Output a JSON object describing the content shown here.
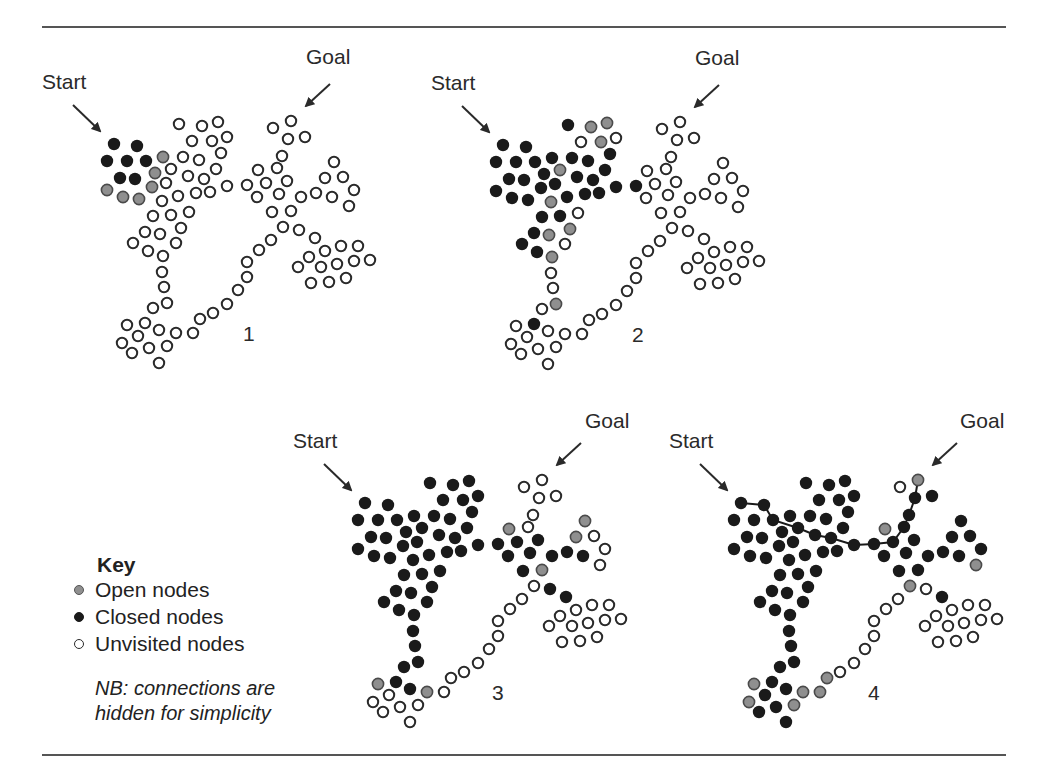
{
  "figure": {
    "rules": {
      "top_y": 27,
      "bottom_y": 755,
      "left_x": 42,
      "right_x": 1006
    },
    "colors": {
      "open": "#8f8f8f",
      "closed": "#1a1a1a",
      "unvisited_fill": "#ffffff",
      "stroke": "#2a2a2a",
      "path": "#1a1a1a"
    }
  },
  "key": {
    "title": "Key",
    "items": [
      {
        "label": "Open nodes",
        "state": "open"
      },
      {
        "label": "Closed nodes",
        "state": "closed"
      },
      {
        "label": "Unvisited nodes",
        "state": "unvisited"
      }
    ],
    "note_line1": "NB: connections are",
    "note_line2": "hidden for simplicity"
  },
  "base_nodes": [
    [
      114,
      144
    ],
    [
      137,
      146
    ],
    [
      107,
      161
    ],
    [
      127,
      161
    ],
    [
      146,
      161
    ],
    [
      120,
      178
    ],
    [
      135,
      179
    ],
    [
      163,
      157
    ],
    [
      155,
      173
    ],
    [
      152,
      187
    ],
    [
      107,
      190
    ],
    [
      123,
      197
    ],
    [
      139,
      199
    ],
    [
      179,
      124
    ],
    [
      202,
      126
    ],
    [
      218,
      122
    ],
    [
      192,
      141
    ],
    [
      212,
      141
    ],
    [
      227,
      137
    ],
    [
      183,
      157
    ],
    [
      199,
      160
    ],
    [
      221,
      153
    ],
    [
      171,
      169
    ],
    [
      188,
      176
    ],
    [
      204,
      179
    ],
    [
      216,
      169
    ],
    [
      166,
      183
    ],
    [
      178,
      196
    ],
    [
      196,
      193
    ],
    [
      210,
      192
    ],
    [
      227,
      186
    ],
    [
      247,
      185
    ],
    [
      162,
      201
    ],
    [
      189,
      212
    ],
    [
      153,
      216
    ],
    [
      171,
      215
    ],
    [
      145,
      232
    ],
    [
      160,
      234
    ],
    [
      181,
      228
    ],
    [
      133,
      243
    ],
    [
      148,
      251
    ],
    [
      163,
      256
    ],
    [
      176,
      243
    ],
    [
      162,
      272
    ],
    [
      164,
      287
    ],
    [
      167,
      303
    ],
    [
      153,
      308
    ],
    [
      145,
      323
    ],
    [
      127,
      325
    ],
    [
      159,
      330
    ],
    [
      176,
      333
    ],
    [
      138,
      336
    ],
    [
      122,
      343
    ],
    [
      149,
      348
    ],
    [
      167,
      346
    ],
    [
      132,
      353
    ],
    [
      159,
      363
    ],
    [
      193,
      333
    ],
    [
      200,
      319
    ],
    [
      213,
      313
    ],
    [
      227,
      304
    ],
    [
      238,
      290
    ],
    [
      247,
      277
    ],
    [
      247,
      262
    ],
    [
      259,
      250
    ],
    [
      271,
      240
    ],
    [
      273,
      128
    ],
    [
      291,
      121
    ],
    [
      288,
      139
    ],
    [
      305,
      137
    ],
    [
      282,
      156
    ],
    [
      258,
      170
    ],
    [
      277,
      168
    ],
    [
      266,
      183
    ],
    [
      287,
      181
    ],
    [
      257,
      197
    ],
    [
      279,
      194
    ],
    [
      301,
      197
    ],
    [
      316,
      193
    ],
    [
      332,
      197
    ],
    [
      272,
      212
    ],
    [
      291,
      211
    ],
    [
      283,
      227
    ],
    [
      299,
      230
    ],
    [
      315,
      238
    ],
    [
      334,
      162
    ],
    [
      325,
      178
    ],
    [
      343,
      177
    ],
    [
      354,
      190
    ],
    [
      349,
      206
    ],
    [
      325,
      251
    ],
    [
      341,
      246
    ],
    [
      358,
      246
    ],
    [
      309,
      257
    ],
    [
      298,
      267
    ],
    [
      321,
      267
    ],
    [
      337,
      264
    ],
    [
      354,
      261
    ],
    [
      370,
      260
    ],
    [
      311,
      283
    ],
    [
      329,
      282
    ],
    [
      346,
      278
    ]
  ],
  "panels": [
    {
      "number": "1",
      "dx": 0,
      "dy": 0,
      "start_label": "Start",
      "start_label_pos": [
        42,
        70
      ],
      "start_arrow": [
        [
          73,
          105
        ],
        [
          100,
          131
        ]
      ],
      "goal_label": "Goal",
      "goal_label_pos": [
        306,
        45
      ],
      "goal_arrow": [
        [
          330,
          84
        ],
        [
          306,
          106
        ]
      ],
      "number_pos": [
        243,
        322
      ],
      "states": "cccccccoooooouuuuuuuuuuuuuuuuuuuuuuuuuuuuuuuuuuuuuuuuuuuuuuuuuuuuuuuuuuuuuuuuuuuuuuuuuuuuuuuuuuuuuuuu",
      "path": []
    },
    {
      "number": "2",
      "dx": 389,
      "dy": 1,
      "start_label": "Start",
      "start_label_pos": [
        431,
        71
      ],
      "start_arrow": [
        [
          462,
          106
        ],
        [
          489,
          132
        ]
      ],
      "goal_label": "Goal",
      "goal_label_pos": [
        695,
        46
      ],
      "goal_arrow": [
        [
          719,
          85
        ],
        [
          695,
          107
        ]
      ],
      "number_pos": [
        632,
        323
      ],
      "states": "ccccccccccccccoououcccocccccccccoucccooccouuuoucuuuuuuuuuuuuuuuuuuuuuuuuuuuuuuuuuuuuuuuuuuuuuuuuuuuuuu",
      "path": []
    },
    {
      "number": "3",
      "dx": 251,
      "dy": 359,
      "start_label": "Start",
      "start_label_pos": [
        293,
        429
      ],
      "start_arrow": [
        [
          324,
          464
        ],
        [
          351,
          490
        ]
      ],
      "goal_label": "Goal",
      "goal_label_pos": [
        585,
        409
      ],
      "goal_arrow": [
        [
          581,
          443
        ],
        [
          557,
          465
        ]
      ],
      "number_pos": [
        492,
        681
      ],
      "states": "ccccccccccccccccccccccccccccccccccccccccccccccccocouuuuuuuuuuuuuuuuuuuuouccccccccouccoouuuuuuuuuuuuuuuuuu",
      "path": []
    },
    {
      "number": "4",
      "dx": 627,
      "dy": 359,
      "start_label": "Start",
      "start_label_pos": [
        669,
        429
      ],
      "start_arrow": [
        [
          700,
          464
        ],
        [
          727,
          490
        ]
      ],
      "goal_label": "Goal",
      "goal_label_pos": [
        960,
        409
      ],
      "goal_arrow": [
        [
          957,
          443
        ],
        [
          933,
          465
        ]
      ],
      "number_pos": [
        868,
        681
      ],
      "states": "ccccccccccccccccccccccccccccccccccccccccccccccccococococcoouuuuuuuuocccoccccccccccoucccccouuuuuuuuuuuuuuuuu",
      "path": [
        0,
        1,
        4,
        22,
        23,
        24,
        30,
        31,
        73,
        72,
        70,
        68,
        67
      ]
    }
  ]
}
